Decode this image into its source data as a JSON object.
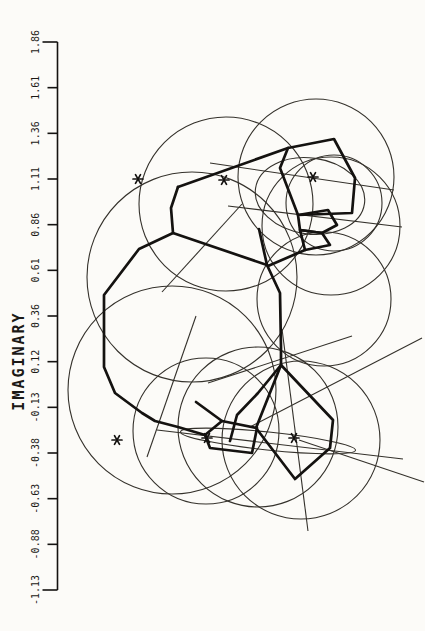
{
  "figure": {
    "background": "#fcfbf8",
    "ink": "#141210",
    "thin_ink": "#34312b",
    "axis": {
      "label": "IMAGINARY",
      "tick_labels": [
        "1.86",
        "1.61",
        "1.36",
        "1.11",
        "0.86",
        "0.61",
        "0.36",
        "0.12",
        "-0.13",
        "-0.38",
        "-0.63",
        "-0.88",
        "-1.13"
      ],
      "x": 57.5,
      "y_top": 42,
      "y_bottom": 590,
      "tick_len": 10,
      "end_tick_len": 15,
      "tick_label_x": 36,
      "tick_font_size": 10,
      "label_x": 19,
      "label_y": 361,
      "label_font_size": 15,
      "label_letter_spacing": 2
    }
  },
  "chart_data": {
    "type": "scatter",
    "title": "",
    "xlabel": "",
    "ylabel": "IMAGINARY",
    "y_axis": {
      "ticks": [
        1.86,
        1.61,
        1.36,
        1.11,
        0.86,
        0.61,
        0.36,
        0.12,
        -0.13,
        -0.38,
        -0.63,
        -0.88,
        -1.13
      ],
      "range": [
        -1.13,
        1.86
      ],
      "orientation": "vertical-rotated-labels"
    },
    "x_axis": {
      "visible": false
    },
    "eigenvalue_markers_imag": [
      1.11,
      1.11,
      1.12,
      -0.31,
      -0.3,
      -0.3
    ],
    "px_mapping": {
      "y_of_imag_max": 42,
      "y_of_imag_min": 590,
      "px_per_unit": 183.3
    },
    "geometry_px": {
      "circles": [
        [
          226,
          204,
          87
        ],
        [
          316,
          177,
          78
        ],
        [
          334,
          203,
          48
        ],
        [
          331,
          226,
          69
        ],
        [
          324,
          299,
          67
        ],
        [
          192,
          277,
          105
        ],
        [
          172,
          390,
          104
        ],
        [
          206,
          431,
          73
        ],
        [
          258,
          427,
          80
        ],
        [
          301,
          440,
          79
        ]
      ],
      "ellipses": [
        [
          310,
          196,
          55,
          38,
          8
        ],
        [
          268,
          441,
          88,
          9,
          6
        ]
      ],
      "thin_lines": [
        [
          210,
          163,
          394,
          190
        ],
        [
          228,
          206,
          402,
          227
        ],
        [
          157,
          430,
          403,
          459
        ],
        [
          242,
          204,
          162,
          292
        ],
        [
          196,
          316,
          147,
          457
        ],
        [
          282,
          329,
          308,
          531
        ],
        [
          299,
          440,
          424,
          482
        ],
        [
          250,
          427,
          422,
          338
        ],
        [
          208,
          383,
          352,
          336
        ]
      ],
      "thick_paths": [
        {
          "points": [
            [
              178,
              187
            ],
            [
              171,
              208
            ],
            [
              173,
              233
            ],
            [
              139,
              249
            ],
            [
              104,
              295
            ],
            [
              104,
              367
            ],
            [
              115,
              393
            ],
            [
              142,
              413
            ],
            [
              155,
              421
            ],
            [
              178,
              427
            ],
            [
              205,
              435
            ]
          ],
          "closed": false
        },
        {
          "points": [
            [
              178,
              187
            ],
            [
              288,
              148
            ]
          ],
          "closed": false
        },
        {
          "points": [
            [
              288,
              148
            ],
            [
              334,
              139
            ],
            [
              355,
              178
            ],
            [
              352,
              213
            ],
            [
              298,
              215
            ],
            [
              280,
              168
            ]
          ],
          "closed": true
        },
        {
          "points": [
            [
              298,
              215
            ],
            [
              328,
              210
            ],
            [
              337,
              225
            ],
            [
              322,
              233
            ],
            [
              300,
              230
            ]
          ],
          "closed": true
        },
        {
          "points": [
            [
              300,
              230
            ],
            [
              322,
              233
            ],
            [
              330,
              245
            ],
            [
              305,
              250
            ]
          ],
          "closed": true
        },
        {
          "points": [
            [
              173,
              233
            ],
            [
              267,
              265
            ]
          ],
          "closed": false
        },
        {
          "points": [
            [
              259,
              229
            ],
            [
              267,
              265
            ]
          ],
          "closed": false
        },
        {
          "points": [
            [
              305,
              250
            ],
            [
              268,
              266
            ]
          ],
          "closed": false
        },
        {
          "points": [
            [
              267,
              265
            ],
            [
              280,
              293
            ],
            [
              281,
              348
            ],
            [
              281,
              365
            ]
          ],
          "closed": false
        },
        {
          "points": [
            [
              281,
              365
            ],
            [
              258,
              393
            ],
            [
              237,
              415
            ],
            [
              230,
              441
            ]
          ],
          "closed": false
        },
        {
          "points": [
            [
              281,
              365
            ],
            [
              333,
              420
            ],
            [
              330,
              448
            ],
            [
              295,
              479
            ],
            [
              256,
              428
            ]
          ],
          "closed": true
        },
        {
          "points": [
            [
              205,
              435
            ],
            [
              222,
              421
            ],
            [
              257,
              428
            ],
            [
              252,
              453
            ],
            [
              210,
              448
            ]
          ],
          "closed": true
        },
        {
          "points": [
            [
              196,
              402
            ],
            [
              222,
              421
            ]
          ],
          "closed": false
        }
      ],
      "asterisks": [
        [
          138,
          179
        ],
        [
          224,
          180
        ],
        [
          313,
          177
        ],
        [
          117,
          440
        ],
        [
          207,
          438
        ],
        [
          294,
          438
        ]
      ],
      "asterisk_radius": 5,
      "thin_width": 1.1,
      "thick_width": 2.7
    }
  }
}
